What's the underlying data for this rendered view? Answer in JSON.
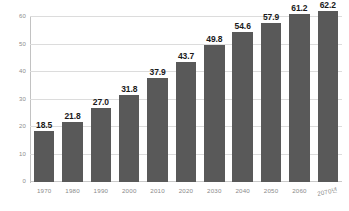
{
  "chart_data": {
    "type": "bar",
    "title": "",
    "subtitle": "",
    "xlabel": "",
    "ylabel": "",
    "categories": [
      "1970",
      "1980",
      "1990",
      "2000",
      "2010",
      "2020",
      "2030",
      "2040",
      "2050",
      "2060",
      "2070년"
    ],
    "values": [
      18.5,
      21.8,
      27.0,
      31.8,
      37.9,
      43.7,
      49.8,
      54.6,
      57.9,
      61.2,
      62.2
    ],
    "data_labels": [
      "18.5",
      "21.8",
      "27.0",
      "31.8",
      "37.9",
      "43.7",
      "49.8",
      "54.6",
      "57.9",
      "61.2",
      "62.2"
    ],
    "ylim": [
      0,
      60
    ],
    "ytick_values": [
      60,
      50,
      40,
      30,
      20,
      10,
      0
    ],
    "ytick_labels": [
      "60",
      "50",
      "40",
      "30",
      "20",
      "10",
      "0"
    ],
    "grid": true,
    "grid_axis": "y",
    "legend": null,
    "legend_position": "none",
    "series": [
      {
        "name": "",
        "values": [
          18.5,
          21.8,
          27.0,
          31.8,
          37.9,
          43.7,
          49.8,
          54.6,
          57.9,
          61.2,
          62.2
        ],
        "color": "#595959"
      }
    ],
    "colors": {
      "bar_fill": "#595959",
      "gridline": "#dcdcdc",
      "axis_line": "#c2c2c2",
      "data_label_text": "#1a1a1a",
      "tick_label_text": "#8a8a8a",
      "background": "#ffffff"
    }
  }
}
